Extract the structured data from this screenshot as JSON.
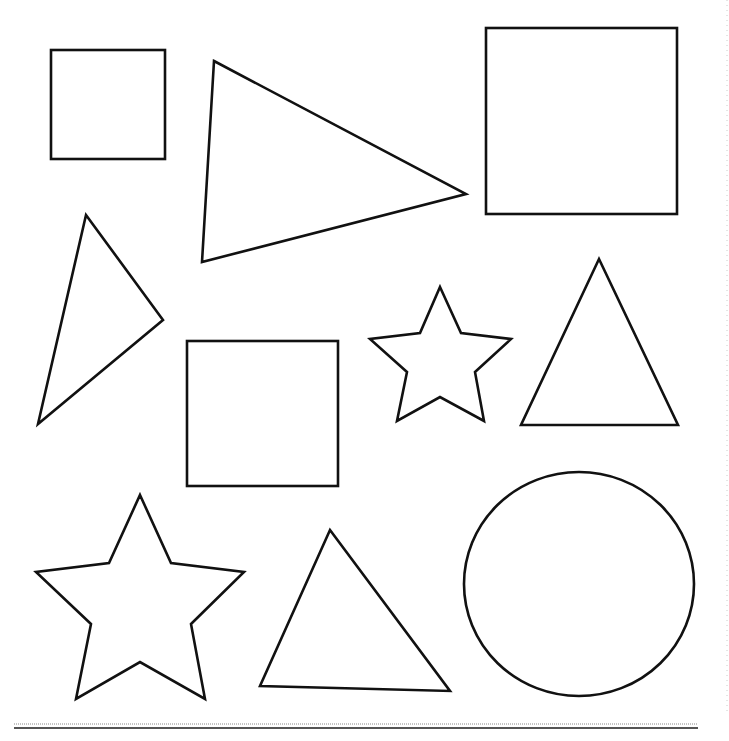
{
  "page": {
    "type": "shapes-worksheet",
    "background": "#ffffff",
    "stroke_color": "#111111"
  },
  "shapes": [
    {
      "kind": "square",
      "label": "small square top-left",
      "x": 51,
      "y": 50,
      "width": 114,
      "height": 109
    },
    {
      "kind": "triangle",
      "label": "scalene triangle top-center",
      "points": "214,61 466,194 202,262"
    },
    {
      "kind": "square",
      "label": "large square top-right",
      "x": 486,
      "y": 28,
      "width": 191,
      "height": 186
    },
    {
      "kind": "triangle",
      "label": "narrow triangle left",
      "points": "86,215 163,320 38,424"
    },
    {
      "kind": "square",
      "label": "square center",
      "x": 187,
      "y": 341,
      "width": 151,
      "height": 145
    },
    {
      "kind": "star",
      "label": "small star center",
      "points": "440,287 461,333 511,339 475,372 484,421 440,397 397,421 407,372 370,339 420,333"
    },
    {
      "kind": "triangle",
      "label": "isosceles triangle right",
      "points": "599,259 678,425 521,425"
    },
    {
      "kind": "star",
      "label": "large star bottom-left",
      "points": "140,495 171,563 244,572 191,624 205,699 140,662 76,699 91,624 36,572 109,563"
    },
    {
      "kind": "triangle",
      "label": "triangle bottom-center",
      "points": "330,530 450,691 260,686"
    },
    {
      "kind": "circle",
      "label": "circle bottom-right",
      "cx": 579,
      "cy": 584,
      "rx": 115,
      "ry": 112
    }
  ],
  "footer": {
    "dotted_rule_y": 724,
    "solid_rule_y": 728,
    "rule_x1": 14,
    "rule_x2": 698
  }
}
